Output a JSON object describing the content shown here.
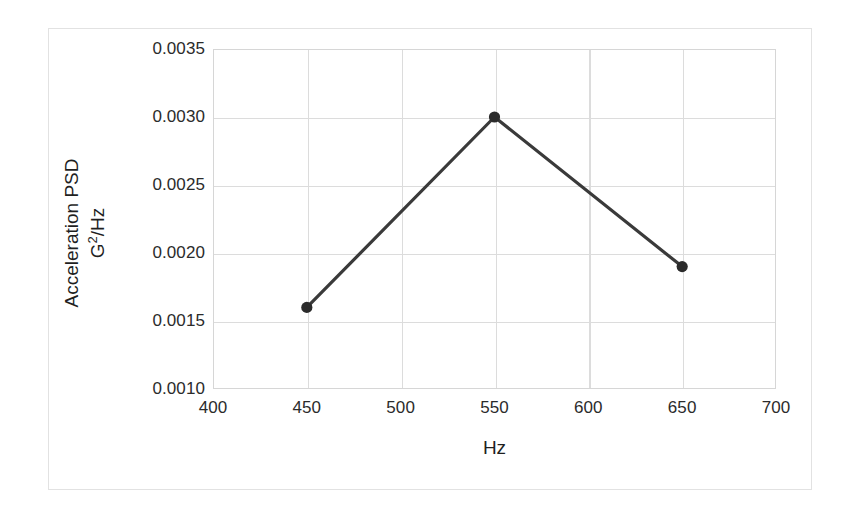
{
  "chart_data": {
    "type": "line",
    "title": "",
    "xlabel": "Hz",
    "ylabel": "Acceleration PSD G2/Hz",
    "ylabel_line1": "Acceleration PSD",
    "ylabel_unit_base": "G",
    "ylabel_unit_sup": "2",
    "ylabel_unit_rest": "/Hz",
    "x": [
      450,
      550,
      650
    ],
    "values": [
      0.0016,
      0.003,
      0.0019
    ],
    "series": [
      {
        "name": "Acceleration PSD",
        "points": [
          {
            "x": 450,
            "y": 0.0016
          },
          {
            "x": 550,
            "y": 0.003
          },
          {
            "x": 650,
            "y": 0.0019
          }
        ]
      }
    ],
    "xlim": [
      400,
      700
    ],
    "ylim": [
      0.001,
      0.0035
    ],
    "xticks": [
      400,
      450,
      500,
      550,
      600,
      650,
      700
    ],
    "xtick_labels": [
      "400",
      "450",
      "500",
      "550",
      "600",
      "650",
      "700"
    ],
    "yticks": [
      0.001,
      0.0015,
      0.002,
      0.0025,
      0.003,
      0.0035
    ],
    "ytick_labels": [
      "0.0010",
      "0.0015",
      "0.0020",
      "0.0025",
      "0.0030",
      "0.0035"
    ],
    "grid": true,
    "legend": false,
    "legend_position": "none",
    "marker": "circle",
    "colors": {
      "line": "#3a3a3a",
      "marker": "#2b2b2b",
      "grid": "#dcdcdc",
      "plot_border": "#d6d6d6",
      "figure_border": "#e2e2e2",
      "background": "#ffffff",
      "text": "#1f1f1f"
    }
  }
}
